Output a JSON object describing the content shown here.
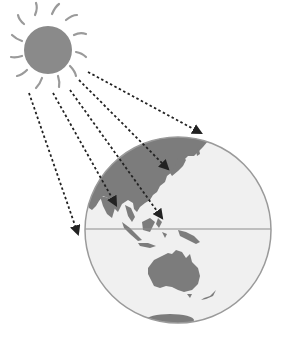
{
  "diagram": {
    "title": "Sunlight rays striking Earth at different angles",
    "colors": {
      "background": "#ffffff",
      "sun_fill": "#8a8a8a",
      "sun_rays": "#9a9a9a",
      "globe_ocean": "#f0f0f0",
      "globe_outline": "#9a9a9a",
      "land": "#7c7c7c",
      "equator": "#8c8c8c",
      "arrow": "#222222"
    },
    "sun": {
      "cx": 48,
      "cy": 50,
      "r": 24,
      "ray_count": 12
    },
    "globe": {
      "cx": 178,
      "cy": 230,
      "r": 93,
      "equator_y": 229
    },
    "rays": [
      {
        "id": "ray-1",
        "x1": 29,
        "y1": 93,
        "x2": 78,
        "y2": 234
      },
      {
        "id": "ray-2",
        "x1": 53,
        "y1": 93,
        "x2": 116,
        "y2": 205
      },
      {
        "id": "ray-3",
        "x1": 70,
        "y1": 90,
        "x2": 162,
        "y2": 218
      },
      {
        "id": "ray-4",
        "x1": 79,
        "y1": 80,
        "x2": 168,
        "y2": 169
      },
      {
        "id": "ray-5",
        "x1": 88,
        "y1": 72,
        "x2": 201,
        "y2": 133
      }
    ],
    "labels": {
      "sun": "Sun",
      "earth": "Earth",
      "equator": "Equator",
      "regions": [
        "Asia",
        "Southeast Asia",
        "Australia",
        "Antarctica",
        "New Zealand",
        "Japan"
      ]
    }
  }
}
